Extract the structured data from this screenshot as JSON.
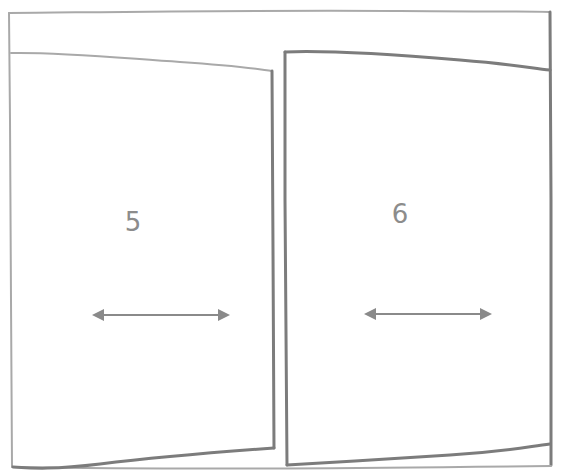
{
  "diagram": {
    "title": "",
    "frame": {
      "description": "outer frame",
      "stroke_color": "#a9a9a9"
    },
    "panels": [
      {
        "id": "left",
        "label": "5",
        "arrow": "double-horizontal-arrow",
        "stroke_color": "#7c7c7c"
      },
      {
        "id": "right",
        "label": "6",
        "arrow": "double-horizontal-arrow",
        "stroke_color": "#7c7c7c"
      }
    ]
  }
}
